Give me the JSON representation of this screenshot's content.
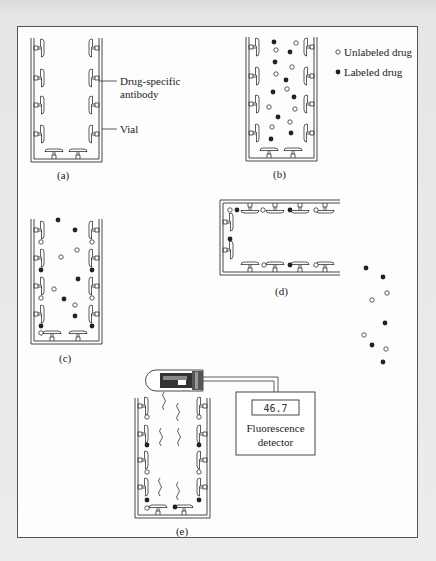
{
  "figure": {
    "panels": [
      {
        "id": "a",
        "label": "(a)"
      },
      {
        "id": "b",
        "label": "(b)"
      },
      {
        "id": "c",
        "label": "(c)"
      },
      {
        "id": "d",
        "label": "(d)"
      },
      {
        "id": "e",
        "label": "(e)"
      }
    ],
    "callouts": {
      "antibody_line1": "Drug-specific",
      "antibody_line2": "antibody",
      "vial": "Vial"
    },
    "legend": {
      "unlabeled": {
        "symbol": "open-circle",
        "label": "Unlabeled drug"
      },
      "labeled": {
        "symbol": "filled-circle",
        "label": "Labeled drug"
      }
    },
    "detector": {
      "reading": "46.7",
      "label_line1": "Fluorescence",
      "label_line2": "detector"
    }
  },
  "colors": {
    "line": "#333333",
    "frame_bg": "#fdfdfd",
    "page_bg": "#e4e4e4"
  }
}
